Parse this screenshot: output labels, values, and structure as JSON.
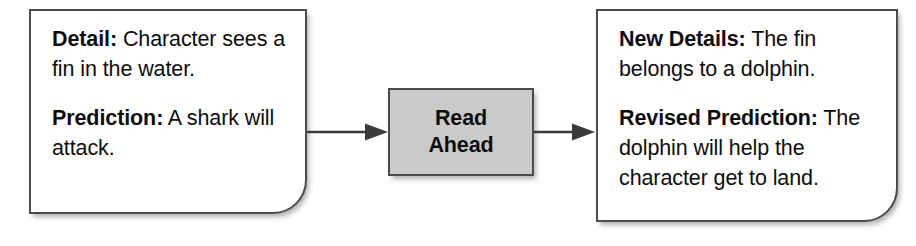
{
  "diagram": {
    "type": "flow",
    "colors": {
      "box_border": "#4c4c4c",
      "box_fill": "#ffffff",
      "process_fill": "#cacaca",
      "text": "#0d0d0d",
      "arrow": "#3b3b3b"
    },
    "nodes": [
      {
        "id": "detail-box",
        "shape": "rounded-bottom-right-rectangle",
        "paragraphs": [
          {
            "lead": "Detail:",
            "body": " Character sees a fin in the water."
          },
          {
            "lead": "Prediction:",
            "body": " A shark will attack."
          }
        ]
      },
      {
        "id": "read-ahead-box",
        "shape": "rectangle",
        "lines": [
          "Read",
          "Ahead"
        ]
      },
      {
        "id": "revised-box",
        "shape": "rounded-bottom-right-rectangle",
        "paragraphs": [
          {
            "lead": "New Details:",
            "body": " The fin belongs to a dolphin."
          },
          {
            "lead": "Revised Prediction:",
            "body": " The dolphin will help the character get to land."
          }
        ]
      }
    ],
    "edges": [
      {
        "id": "edge-detail-to-read-ahead",
        "from": "detail-box",
        "to": "read-ahead-box",
        "marker": "arrowhead"
      },
      {
        "id": "edge-read-ahead-to-revised",
        "from": "read-ahead-box",
        "to": "revised-box",
        "marker": "arrowhead"
      }
    ]
  }
}
